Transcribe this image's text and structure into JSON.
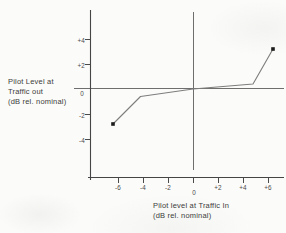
{
  "figure": {
    "background": "#fbfbf9"
  },
  "axes": {
    "y": {
      "title_lines": [
        "Pilot Level at",
        "Traffic out",
        "(dB rel. nominal)"
      ],
      "tick_values": [
        4,
        2,
        0,
        -2,
        -4
      ],
      "tick_labels": [
        "+4",
        "+2",
        "0",
        "-2",
        "-4"
      ]
    },
    "x": {
      "title_lines": [
        "Pilot level at Traffic In",
        "(dB rel. nominal)"
      ],
      "tick_values": [
        -6,
        -4,
        -2,
        0,
        2,
        4,
        6
      ],
      "tick_labels": [
        "-6",
        "-4",
        "-2",
        "0",
        "+2",
        "+4",
        "+6"
      ]
    }
  },
  "chart_data": {
    "type": "line",
    "title": "",
    "xlabel": "Pilot level at Traffic In (dB rel. nominal)",
    "ylabel": "Pilot Level at Traffic out (dB rel. nominal)",
    "xlim": [
      -8.4,
      7.3
    ],
    "ylim": [
      -7.1,
      6.3
    ],
    "x_ticks": [
      -6,
      -4,
      -2,
      0,
      2,
      4,
      6
    ],
    "y_ticks": [
      4,
      2,
      0,
      -2,
      -4
    ],
    "grid": false,
    "legend": null,
    "reference_lines": {
      "horizontal_y": 0,
      "vertical_x": 0
    },
    "series": [
      {
        "name": "pilot-transfer-characteristic",
        "marker": "square",
        "marker_at": "ends",
        "points": [
          [
            -6.4,
            -2.8
          ],
          [
            -4.2,
            -0.6
          ],
          [
            0,
            0
          ],
          [
            4.8,
            0.4
          ],
          [
            6.4,
            3.2
          ]
        ]
      }
    ]
  },
  "colors": {
    "background": "#fbfbf9",
    "axis": "#454545",
    "tick": "#4a4a4a",
    "reference_line": "#6e6e6e",
    "data_line": "#7d7d7d",
    "marker": "#1c1c1c",
    "text": "#3c3c3c"
  }
}
